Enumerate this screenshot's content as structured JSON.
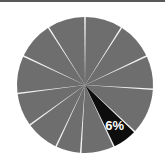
{
  "figure": {
    "width": 165,
    "height": 163,
    "background_color": "#ffffff",
    "top_rule_color": "#585858"
  },
  "chart_data": {
    "type": "pie",
    "title": "",
    "subtitle": "",
    "xlabel": "",
    "ylabel": "",
    "legend": "none",
    "grid": false,
    "start_angle_deg": 0,
    "direction": "clockwise",
    "center": {
      "cx": 85,
      "cy": 85
    },
    "radius": 68,
    "slice_gap_color": "#f2f2f2",
    "slice_gap_width": 2,
    "default_slice_color": "#6e6e6e",
    "highlight_slice_color": "#0d0d0d",
    "highlight_label_color": "#ffffff",
    "categories": [
      "Segment 1",
      "Segment 2",
      "Segment 3",
      "Segment 4",
      "Segment 5",
      "Segment 6",
      "Segment 7",
      "Segment 8",
      "Segment 9",
      "Segment 10",
      "Segment 11",
      "Segment 12"
    ],
    "values": [
      9,
      9,
      8,
      11,
      6,
      8,
      6,
      8,
      8,
      9,
      9,
      9
    ],
    "labels": [
      "",
      "",
      "",
      "",
      "6%",
      "",
      "",
      "",
      "",
      "",
      "",
      ""
    ],
    "highlighted_index": 4,
    "slices": [
      {
        "name": "Segment 1",
        "value": 9,
        "color": "#6e6e6e",
        "label": "",
        "highlighted": false
      },
      {
        "name": "Segment 2",
        "value": 9,
        "color": "#6e6e6e",
        "label": "",
        "highlighted": false
      },
      {
        "name": "Segment 3",
        "value": 8,
        "color": "#6e6e6e",
        "label": "",
        "highlighted": false
      },
      {
        "name": "Segment 4",
        "value": 11,
        "color": "#6e6e6e",
        "label": "",
        "highlighted": false
      },
      {
        "name": "Segment 5",
        "value": 6,
        "color": "#0d0d0d",
        "label": "6%",
        "highlighted": true
      },
      {
        "name": "Segment 6",
        "value": 8,
        "color": "#6e6e6e",
        "label": "",
        "highlighted": false
      },
      {
        "name": "Segment 7",
        "value": 6,
        "color": "#6e6e6e",
        "label": "",
        "highlighted": false
      },
      {
        "name": "Segment 8",
        "value": 8,
        "color": "#6e6e6e",
        "label": "",
        "highlighted": false
      },
      {
        "name": "Segment 9",
        "value": 8,
        "color": "#6e6e6e",
        "label": "",
        "highlighted": false
      },
      {
        "name": "Segment 10",
        "value": 9,
        "color": "#6e6e6e",
        "label": "",
        "highlighted": false
      },
      {
        "name": "Segment 11",
        "value": 9,
        "color": "#6e6e6e",
        "label": "",
        "highlighted": false
      },
      {
        "name": "Segment 12",
        "value": 9,
        "color": "#6e6e6e",
        "label": "",
        "highlighted": false
      }
    ],
    "visible_labels": [
      {
        "text": "6%",
        "slice_index": 4
      }
    ]
  }
}
